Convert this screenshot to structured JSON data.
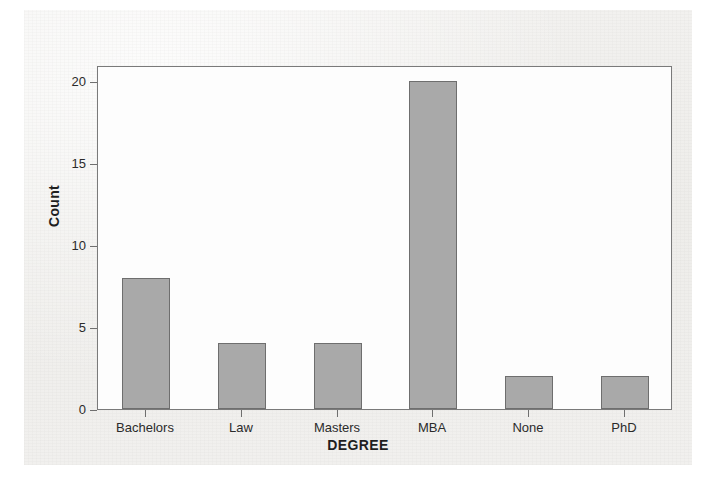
{
  "chart_data": {
    "type": "bar",
    "title": "",
    "categories": [
      "Bachelors",
      "Law",
      "Masters",
      "MBA",
      "None",
      "PhD"
    ],
    "values": [
      8,
      4,
      4,
      20,
      2,
      2
    ],
    "xlabel": "DEGREE",
    "ylabel": "Count",
    "ylim": [
      0,
      21
    ],
    "yticks": [
      0,
      5,
      10,
      15,
      20
    ],
    "ytick_labels": [
      "0",
      "5",
      "10",
      "15",
      "20"
    ],
    "grid": false,
    "legend": null,
    "bar_color": "#a9a9a9",
    "bar_edge_color": "#6e6e6e",
    "frame_color": "#7a7a7a",
    "background_color": "#f1f0ee",
    "plot_background_color": "#fdfdfd"
  },
  "axes": {
    "y_title": "Count",
    "x_title": "DEGREE"
  }
}
